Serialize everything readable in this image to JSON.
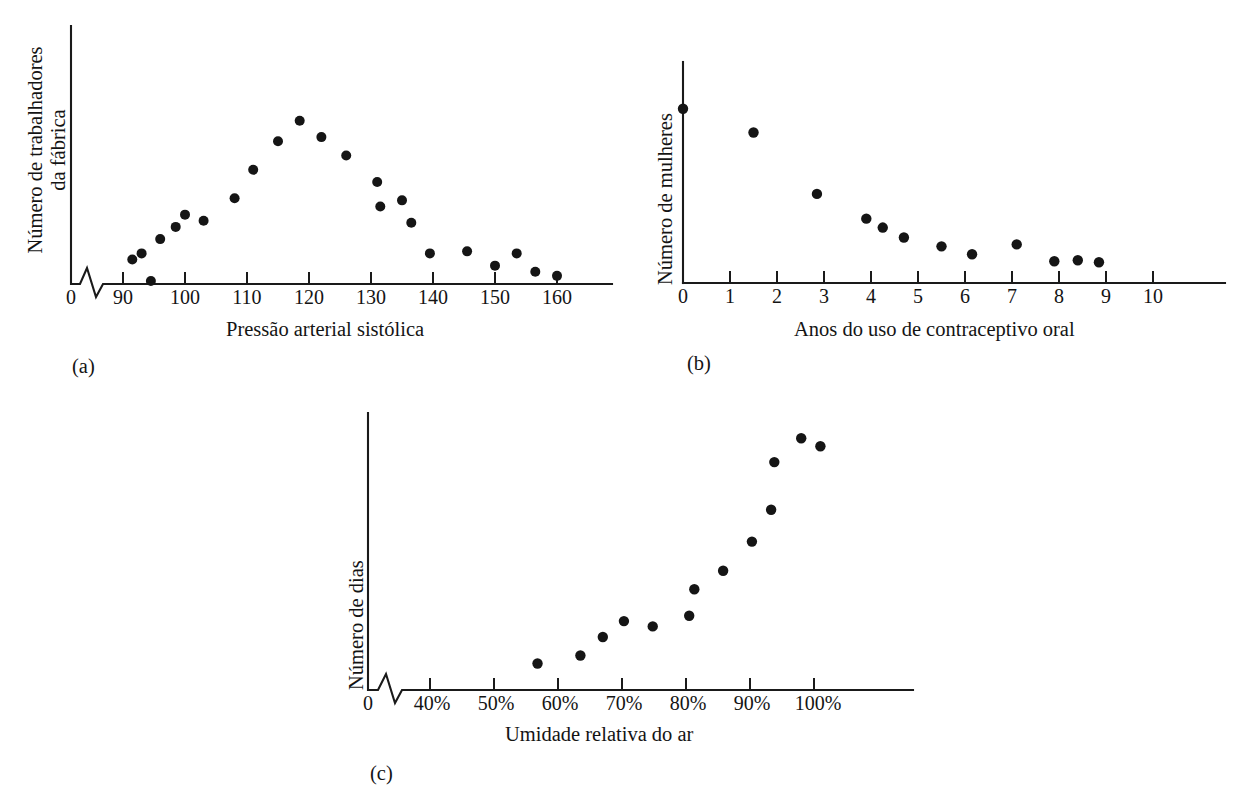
{
  "figure": {
    "title": "",
    "panels": [
      "(a)",
      "(b)",
      "(c)"
    ]
  },
  "panel_a": {
    "letter": "(a)",
    "ylabel_line1": "Número de trabalhadores",
    "ylabel_line2": "da fábrica",
    "xlabel": "Pressão arterial sistólica",
    "origin_label": "0",
    "tick_labels": [
      "90",
      "100",
      "110",
      "120",
      "130",
      "140",
      "150",
      "160"
    ],
    "axis_break": true
  },
  "panel_b": {
    "letter": "(b)",
    "ylabel_line1": "Número de mulheres",
    "ylabel_line2": "",
    "xlabel": "Anos do uso de contraceptivo oral",
    "origin_label": "0",
    "tick_labels": [
      "0",
      "1",
      "2",
      "3",
      "4",
      "5",
      "6",
      "7",
      "8",
      "9",
      "10"
    ],
    "axis_break": false
  },
  "panel_c": {
    "letter": "(c)",
    "ylabel_line1": "Número de dias",
    "ylabel_line2": "",
    "xlabel": "Umidade relativa do ar",
    "origin_label": "0",
    "tick_labels": [
      "40%",
      "50%",
      "60%",
      "70%",
      "80%",
      "90%",
      "100%"
    ],
    "axis_break": true
  },
  "colors": {
    "ink": "#151515",
    "background": "#ffffff"
  },
  "chart_data": [
    {
      "type": "scatter",
      "id": "a",
      "title": "",
      "xlabel": "Pressão arterial sistólica",
      "ylabel": "Número de trabalhadores da fábrica",
      "xlim": [
        88,
        170
      ],
      "ylim": [
        0,
        100
      ],
      "xticks": [
        90,
        100,
        110,
        120,
        130,
        140,
        150,
        160
      ],
      "xticklabels": [
        "90",
        "100",
        "110",
        "120",
        "130",
        "140",
        "150",
        "160"
      ],
      "grid": false,
      "legend": "none",
      "axis_break_x": true,
      "x": [
        91.5,
        93.0,
        94.5,
        96.0,
        98.5,
        100.0,
        103.0,
        108.0,
        111.0,
        115.0,
        118.5,
        122.0,
        126.0,
        131.0,
        131.5,
        135.0,
        136.5,
        139.5,
        145.5,
        150.0,
        153.5,
        156.5,
        160.0
      ],
      "y": [
        12.0,
        15.0,
        1.5,
        22.0,
        28.0,
        34.0,
        31.0,
        42.0,
        56.0,
        70.0,
        80.0,
        72.0,
        63.0,
        50.0,
        38.0,
        41.0,
        30.0,
        15.0,
        16.0,
        9.0,
        15.0,
        6.0,
        4.0
      ]
    },
    {
      "type": "scatter",
      "id": "b",
      "title": "",
      "xlabel": "Anos do uso de contraceptivo oral",
      "ylabel": "Número de mulheres",
      "xlim": [
        -0.15,
        11.0
      ],
      "ylim": [
        0,
        100
      ],
      "xticks": [
        0,
        1,
        2,
        3,
        4,
        5,
        6,
        7,
        8,
        9,
        10
      ],
      "xticklabels": [
        "0",
        "1",
        "2",
        "3",
        "4",
        "5",
        "6",
        "7",
        "8",
        "9",
        "10"
      ],
      "grid": false,
      "legend": "none",
      "axis_break_x": false,
      "x": [
        0.0,
        1.5,
        2.85,
        3.9,
        4.25,
        4.7,
        5.5,
        6.15,
        7.1,
        7.9,
        8.4,
        8.85
      ],
      "y": [
        88.0,
        76.0,
        45.0,
        32.5,
        28.0,
        23.0,
        18.5,
        14.5,
        19.5,
        11.0,
        11.5,
        10.5
      ]
    },
    {
      "type": "scatter",
      "id": "c",
      "title": "",
      "xlabel": "Umidade relativa do ar",
      "ylabel": "Número de dias",
      "xlim": [
        35,
        112
      ],
      "ylim": [
        0,
        100
      ],
      "xticks": [
        40,
        50,
        60,
        70,
        80,
        90,
        100
      ],
      "xticklabels": [
        "40%",
        "50%",
        "60%",
        "70%",
        "80%",
        "90%",
        "100%"
      ],
      "grid": false,
      "legend": "none",
      "axis_break_x": true,
      "x": [
        56.8,
        63.5,
        67.0,
        70.3,
        74.8,
        80.5,
        81.3,
        85.8,
        90.3,
        93.3,
        93.8,
        98.0,
        101.0
      ],
      "y": [
        10.0,
        13.0,
        20.0,
        26.0,
        24.0,
        28.0,
        38.0,
        45.0,
        56.0,
        68.0,
        86.0,
        95.0,
        92.0
      ]
    }
  ]
}
